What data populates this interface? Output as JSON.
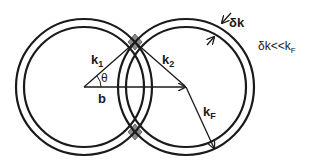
{
  "diagram": {
    "type": "fermi-sphere-overlap",
    "colors": {
      "stroke": "#1a1a1a",
      "overlap_fill": "#8a8a8a",
      "background": "#ffffff"
    },
    "labels": {
      "k1": "k",
      "k1_sub": "1",
      "k2": "k",
      "k2_sub": "2",
      "theta": "θ",
      "b": "b",
      "kF": "k",
      "kF_sub": "F",
      "delta_k": "δk",
      "condition_main": "δk<<k",
      "condition_sub": "F"
    },
    "shells": [
      {
        "name": "left-shell",
        "center": [
          84,
          87
        ],
        "outer_radius": 68,
        "inner_radius": 60
      },
      {
        "name": "right-shell",
        "center": [
          186,
          87
        ],
        "outer_radius": 68,
        "inner_radius": 60
      }
    ]
  }
}
